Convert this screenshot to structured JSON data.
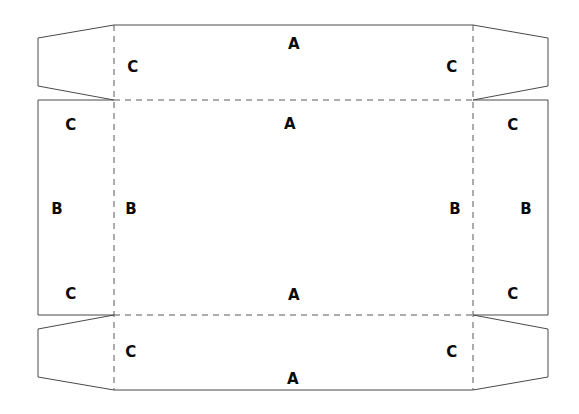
{
  "diagram": {
    "type": "packaging-dieline",
    "background_color": "#ffffff",
    "cut_line_color": "#4a4a4a",
    "fold_line_color": "#5a5a5a",
    "label_color": "#0a0a0a",
    "cut_line_width": 1,
    "fold_line_width": 1,
    "fold_dash_pattern": "6,5"
  },
  "geometry": {
    "canvas": {
      "width": 579,
      "height": 414
    },
    "fold_lines": {
      "vertical_left_x": 114,
      "vertical_right_x": 473,
      "horizontal_top_y": 100,
      "horizontal_bottom_y": 315
    },
    "body": {
      "left_x": 38,
      "right_x": 548,
      "top_y": 25,
      "bottom_y": 390
    },
    "flap_inset_y_top": 38,
    "flap_inset_y_bottom": 377,
    "side_panel_top_y": 100,
    "side_panel_bottom_y": 315
  },
  "panels": [
    {
      "id": "top-main-panel",
      "letter": "A",
      "role": "top-outer-flap"
    },
    {
      "id": "top-inner-panel",
      "letter": "A",
      "role": "top-face"
    },
    {
      "id": "bottom-inner-panel",
      "letter": "A",
      "role": "bottom-face"
    },
    {
      "id": "bottom-main-panel",
      "letter": "A",
      "role": "bottom-outer-flap"
    },
    {
      "id": "left-outer-panel",
      "letter": "B",
      "role": "left-outer-side"
    },
    {
      "id": "left-inner-panel",
      "letter": "B",
      "role": "left-side"
    },
    {
      "id": "right-inner-panel",
      "letter": "B",
      "role": "right-side"
    },
    {
      "id": "right-outer-panel",
      "letter": "B",
      "role": "right-outer-side"
    }
  ],
  "labels": [
    {
      "id": "label-a-top-outer",
      "text": "A",
      "x": 294,
      "y": 44,
      "name": "panel-label-a-top-outer"
    },
    {
      "id": "label-a-top-inner",
      "text": "A",
      "x": 290,
      "y": 124,
      "name": "panel-label-a-top-inner"
    },
    {
      "id": "label-a-bottom-inner",
      "text": "A",
      "x": 294,
      "y": 295,
      "name": "panel-label-a-bottom-inner"
    },
    {
      "id": "label-a-bottom-outer",
      "text": "A",
      "x": 293,
      "y": 379,
      "name": "panel-label-a-bottom-outer"
    },
    {
      "id": "label-b-left-outer",
      "text": "B",
      "x": 57,
      "y": 209,
      "name": "panel-label-b-left-outer"
    },
    {
      "id": "label-b-left-inner",
      "text": "B",
      "x": 131,
      "y": 209,
      "name": "panel-label-b-left-inner"
    },
    {
      "id": "label-b-right-inner",
      "text": "B",
      "x": 455,
      "y": 209,
      "name": "panel-label-b-right-inner"
    },
    {
      "id": "label-b-right-outer",
      "text": "B",
      "x": 526,
      "y": 209,
      "name": "panel-label-b-right-outer"
    },
    {
      "id": "label-c-tl-flap",
      "text": "C",
      "x": 133,
      "y": 67,
      "name": "flap-label-c-top-left"
    },
    {
      "id": "label-c-tr-flap",
      "text": "C",
      "x": 452,
      "y": 67,
      "name": "flap-label-c-top-right"
    },
    {
      "id": "label-c-tl-panel",
      "text": "C",
      "x": 71,
      "y": 125,
      "name": "corner-label-c-upper-left"
    },
    {
      "id": "label-c-tr-panel",
      "text": "C",
      "x": 513,
      "y": 125,
      "name": "corner-label-c-upper-right"
    },
    {
      "id": "label-c-bl-panel",
      "text": "C",
      "x": 71,
      "y": 294,
      "name": "corner-label-c-lower-left"
    },
    {
      "id": "label-c-br-panel",
      "text": "C",
      "x": 513,
      "y": 294,
      "name": "corner-label-c-lower-right"
    },
    {
      "id": "label-c-bl-flap",
      "text": "C",
      "x": 131,
      "y": 352,
      "name": "flap-label-c-bottom-left"
    },
    {
      "id": "label-c-br-flap",
      "text": "C",
      "x": 452,
      "y": 352,
      "name": "flap-label-c-bottom-right"
    }
  ],
  "cut_paths": {
    "top_assembly": "M 38,38 L 38,86 L 114,100 L 114,25 Z",
    "top_panel_outline": "M 114,25 L 473,25 L 473,100 L 114,100 Z",
    "top_right_flap": "M 473,25 L 548,38 L 548,86 L 473,100 Z",
    "left_panel": "M 38,100 L 114,100 L 114,315 L 38,315 Z",
    "right_panel": "M 473,100 L 548,100 L 548,315 L 473,315 Z",
    "bottom_left_flap": "M 38,329 L 114,315 L 114,390 L 38,377 Z",
    "bottom_panel_outline": "M 114,315 L 473,315 L 473,390 L 114,390 Z",
    "bottom_right_flap": "M 473,315 L 548,329 L 548,377 L 473,390 Z"
  }
}
